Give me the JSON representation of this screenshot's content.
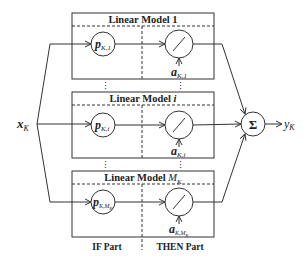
{
  "diagram": {
    "input_label": "x",
    "input_sub": "K",
    "output_label": "y",
    "output_sub": "K",
    "sum_symbol": "Σ",
    "models": [
      {
        "title": "Linear Model 1",
        "title_main": "Linear Model ",
        "title_idx": "1",
        "p_main": "p",
        "p_sub": "K,1",
        "a_main": "a",
        "a_sub": "K,1"
      },
      {
        "title": "Linear Model i",
        "title_main": "Linear Model ",
        "title_idx": "i",
        "p_main": "p",
        "p_sub": "K,i",
        "a_main": "a",
        "a_sub": "K,i"
      },
      {
        "title": "Linear Model M_K",
        "title_main": "Linear Model ",
        "title_idx": "M",
        "title_idx_sub": "K",
        "p_main": "p",
        "p_sub": "K,M",
        "p_sub2": "K",
        "a_main": "a",
        "a_sub": "K,M",
        "a_sub2": "K"
      }
    ],
    "part_labels": {
      "if": "IF Part",
      "then": "THEN Part"
    },
    "ellipsis": "⋮",
    "colors": {
      "line": "#333333",
      "background": "#ffffff"
    }
  }
}
